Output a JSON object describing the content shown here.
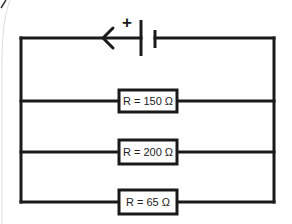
{
  "diagram": {
    "type": "parallel-circuit",
    "battery": {
      "polarity_label": "+",
      "current_direction": "left"
    },
    "resistors": [
      {
        "label": "R = 150 Ω",
        "value_ohms": 150
      },
      {
        "label": "R = 200 Ω",
        "value_ohms": 200
      },
      {
        "label": "R = 65 Ω",
        "value_ohms": 65
      }
    ],
    "colors": {
      "wire": "#1a1a1a",
      "background": "#ffffff",
      "text": "#222222"
    }
  }
}
